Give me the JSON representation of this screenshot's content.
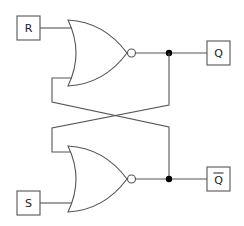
{
  "diagram": {
    "type": "SR latch (cross-coupled NOR gates)",
    "inputs": [
      {
        "id": "R",
        "label": "R"
      },
      {
        "id": "S",
        "label": "S"
      }
    ],
    "outputs": [
      {
        "id": "Q",
        "label": "Q"
      },
      {
        "id": "Qbar",
        "label": "Q",
        "overline": true
      }
    ],
    "gates": [
      {
        "id": "nor_top",
        "type": "NOR",
        "inputs": [
          "R",
          "Qbar"
        ],
        "output": "Q"
      },
      {
        "id": "nor_bottom",
        "type": "NOR",
        "inputs": [
          "Q",
          "S"
        ],
        "output": "Qbar"
      }
    ],
    "colors": {
      "stroke": "#555555",
      "junction": "#000000",
      "background": "#ffffff"
    }
  }
}
